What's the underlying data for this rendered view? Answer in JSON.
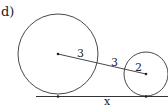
{
  "figure": {
    "part_label": "d)",
    "large_circle": {
      "radius_label": "3"
    },
    "small_circle": {
      "radius_label": "2"
    },
    "segment_between_circles_label": "3",
    "tangent_length_label": "x",
    "colors": {
      "stroke": "#333333",
      "background": "#ffffff"
    }
  }
}
